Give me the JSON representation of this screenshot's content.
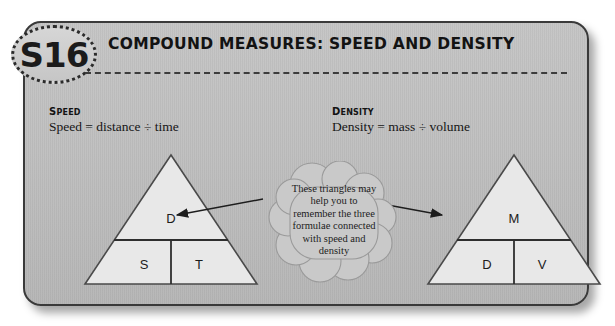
{
  "badge": {
    "label": "S16"
  },
  "header": {
    "title": "COMPOUND MEASURES: SPEED AND DENSITY"
  },
  "sections": {
    "speed": {
      "heading": "SPEED",
      "formula": "Speed = distance ÷ time"
    },
    "density": {
      "heading": "DENSITY",
      "formula": "Density = mass ÷ volume"
    }
  },
  "triangles": {
    "speed": {
      "top": "D",
      "bottom_left": "S",
      "bottom_right": "T"
    },
    "density": {
      "top": "M",
      "bottom_left": "D",
      "bottom_right": "V"
    }
  },
  "callout": {
    "text": "These triangles may help you to remember the three formulae connected with speed and density"
  },
  "colors": {
    "panel_fill": "#bdbdbd",
    "panel_border": "#3a3a3a",
    "triangle_fill": "#e8e8e8",
    "triangle_border": "#4a4a4a",
    "cloud_fill": "#c9c9c9",
    "cloud_border": "#8e8e8e",
    "text": "#131313",
    "arrow": "#1d1d1d"
  }
}
